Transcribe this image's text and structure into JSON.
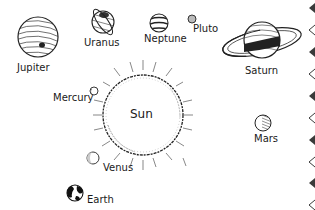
{
  "illustration": {
    "subject": "Solar system line drawing",
    "sun": {
      "label": "Sun",
      "cx": 143,
      "cy": 115,
      "r": 40
    },
    "planets": [
      {
        "name": "Jupiter",
        "label": "Jupiter",
        "cx": 38,
        "cy": 37,
        "r": 20,
        "label_x": 17,
        "label_y": 63
      },
      {
        "name": "Uranus",
        "label": "Uranus",
        "cx": 103,
        "cy": 22,
        "r": 12,
        "label_x": 84,
        "label_y": 38
      },
      {
        "name": "Neptune",
        "label": "Neptune",
        "cx": 159,
        "cy": 23,
        "r": 9,
        "label_x": 144,
        "label_y": 34
      },
      {
        "name": "Pluto",
        "label": "Pluto",
        "cx": 192,
        "cy": 19,
        "r": 4,
        "label_x": 193,
        "label_y": 24
      },
      {
        "name": "Saturn",
        "label": "Saturn",
        "cx": 262,
        "cy": 40,
        "r": 18,
        "label_x": 245,
        "label_y": 66
      },
      {
        "name": "Mercury",
        "label": "Mercury",
        "cx": 94,
        "cy": 91,
        "r": 4,
        "label_x": 53,
        "label_y": 93
      },
      {
        "name": "Venus",
        "label": "Venus",
        "cx": 93,
        "cy": 158,
        "r": 6,
        "label_x": 103,
        "label_y": 163
      },
      {
        "name": "Earth",
        "label": "Earth",
        "cx": 75,
        "cy": 193,
        "r": 8,
        "label_x": 87,
        "label_y": 195
      },
      {
        "name": "Mars",
        "label": "Mars",
        "cx": 263,
        "cy": 123,
        "r": 8,
        "label_x": 254,
        "label_y": 134
      }
    ]
  },
  "border_strip": {
    "pattern": [
      "filled-diamond",
      "outline-chevron",
      "filled-diamond",
      "outline-chevron",
      "filled-diamond",
      "outline-chevron",
      "filled-diamond",
      "outline-chevron",
      "filled-diamond",
      "outline-chevron"
    ],
    "color": "#3a3a3a"
  }
}
